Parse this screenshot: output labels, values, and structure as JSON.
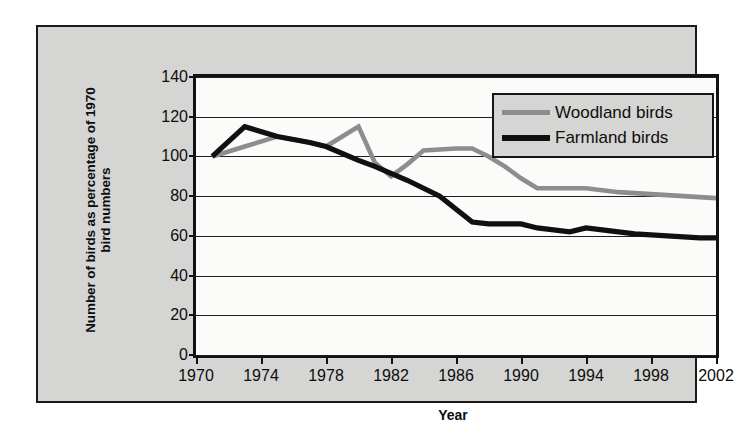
{
  "chart_data": {
    "type": "line",
    "title": "",
    "xlabel": "Year",
    "ylabel": "Number of birds as percentage of 1970 bird numbers",
    "xlim": [
      1970,
      2002
    ],
    "ylim": [
      0,
      140
    ],
    "grid": true,
    "legend_position": "top-right",
    "y_ticks": [
      140,
      120,
      100,
      80,
      60,
      40,
      20,
      0
    ],
    "x_ticks": [
      1970,
      1974,
      1978,
      1982,
      1986,
      1990,
      1994,
      1998,
      2002
    ],
    "series": [
      {
        "name": "Woodland birds",
        "color": "#8d8d8d",
        "x": [
          1971,
          1973,
          1975,
          1977,
          1978,
          1979,
          1980,
          1981,
          1982,
          1983,
          1984,
          1986,
          1987,
          1988,
          1989,
          1990,
          1991,
          1992,
          1994,
          1996,
          1998,
          2000,
          2002
        ],
        "values": [
          100,
          105,
          110,
          107,
          105,
          110,
          115,
          97,
          90,
          96,
          103,
          104,
          104,
          100,
          95,
          89,
          84,
          84,
          84,
          82,
          81,
          80,
          79
        ]
      },
      {
        "name": "Farmland birds",
        "color": "#101010",
        "x": [
          1971,
          1973,
          1975,
          1977,
          1978,
          1980,
          1981,
          1983,
          1985,
          1987,
          1988,
          1990,
          1991,
          1993,
          1994,
          1995,
          1997,
          1999,
          2001,
          2002
        ],
        "values": [
          100,
          115,
          110,
          107,
          105,
          98,
          95,
          88,
          80,
          67,
          66,
          66,
          64,
          62,
          64,
          63,
          61,
          60,
          59,
          59
        ]
      }
    ]
  },
  "legend": {
    "items": [
      {
        "label": "Woodland birds"
      },
      {
        "label": "Farmland birds"
      }
    ]
  },
  "axes": {
    "y_title": "Number of birds as percentage of 1970 bird numbers",
    "x_title": "Year",
    "y_tick_labels": [
      "140",
      "120",
      "100",
      "80",
      "60",
      "40",
      "20",
      "0"
    ],
    "x_tick_labels": [
      "1970",
      "1974",
      "1978",
      "1982",
      "1986",
      "1990",
      "1994",
      "1998",
      "2002"
    ]
  },
  "colors": {
    "frame_background": "#d5d5d3",
    "plot_background": "#fbfbfa",
    "axis": "#121212",
    "woodland": "#8d8d8d",
    "farmland": "#101010"
  }
}
